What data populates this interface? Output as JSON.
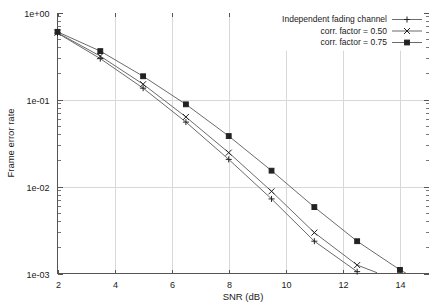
{
  "chart_data": {
    "type": "line",
    "title": "",
    "xlabel": "SNR (dB)",
    "ylabel": "Frame error rate",
    "xlim": [
      2,
      15
    ],
    "ylim": [
      0.001,
      1
    ],
    "yscale": "log",
    "grid": true,
    "legend_position": "top-right",
    "x_ticks": [
      2,
      4,
      6,
      8,
      10,
      12,
      14
    ],
    "x_tick_labels": [
      "2",
      "4",
      "6",
      "8",
      "10",
      "12",
      "14"
    ],
    "y_ticks": [
      1,
      0.1,
      0.01,
      0.001
    ],
    "y_tick_labels": [
      "1e+00",
      "1e-01",
      "1e-02",
      "1e-03"
    ],
    "series": [
      {
        "name": "Independent fading channel",
        "marker": "plus",
        "x": [
          2,
          3.5,
          5,
          6.5,
          8,
          9.5,
          11,
          12.5
        ],
        "y": [
          0.58,
          0.295,
          0.135,
          0.055,
          0.0205,
          0.0072,
          0.00235,
          0.00105
        ]
      },
      {
        "name": "corr. factor = 0.50",
        "marker": "cross",
        "x": [
          2,
          3.5,
          5,
          6.5,
          8,
          9.5,
          11,
          12.5,
          13.2
        ],
        "y": [
          0.585,
          0.315,
          0.15,
          0.063,
          0.0245,
          0.0088,
          0.00295,
          0.00125,
          0.00102
        ]
      },
      {
        "name": "corr. factor = 0.75",
        "marker": "square",
        "x": [
          2,
          3.5,
          5,
          6.5,
          8,
          9.5,
          11,
          12.5,
          14,
          15
        ],
        "y": [
          0.6,
          0.36,
          0.185,
          0.088,
          0.038,
          0.0152,
          0.0058,
          0.00235,
          0.0011,
          0.00073
        ]
      }
    ]
  },
  "legend": {
    "entries": [
      {
        "label": "Independent fading channel",
        "marker": "plus"
      },
      {
        "label": "corr. factor = 0.50",
        "marker": "cross"
      },
      {
        "label": "corr. factor = 0.75",
        "marker": "square"
      }
    ]
  },
  "axes": {
    "x_title": "SNR (dB)",
    "y_title": "Frame error rate"
  }
}
